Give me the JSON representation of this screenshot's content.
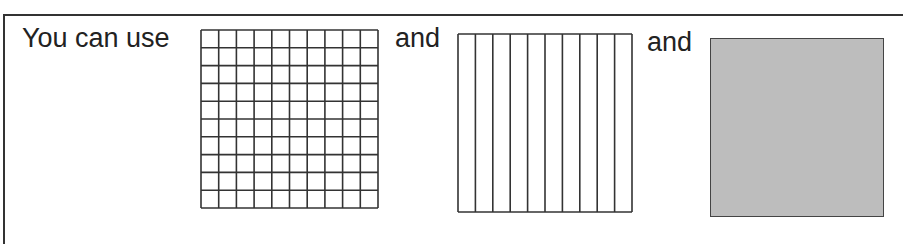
{
  "sentence": {
    "intro": "You can use",
    "conj1": "and",
    "conj2": "and"
  },
  "blocks": [
    {
      "name": "hundreds-flat",
      "description": "10 by 10 grid of unit squares",
      "rows": 10,
      "cols": 10
    },
    {
      "name": "tens-rods",
      "description": "square divided into 10 vertical strips",
      "strips": 10
    },
    {
      "name": "shaded-whole",
      "description": "solid shaded square"
    }
  ],
  "colors": {
    "line": "#333333",
    "shade": "#bdbdbd",
    "background": "#ffffff"
  }
}
